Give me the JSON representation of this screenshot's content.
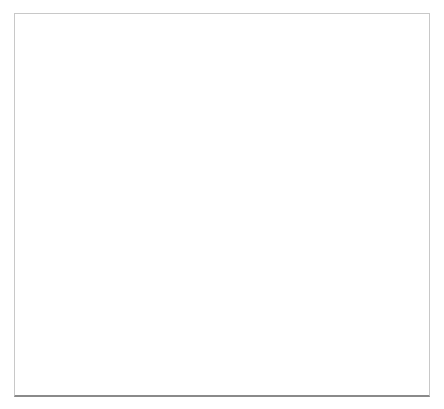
{
  "axis": {
    "unit_label": "cal BP",
    "ticks": [
      5900,
      5800,
      5700,
      5600,
      5500,
      5400,
      5300,
      5200,
      5100,
      5000,
      4900,
      4800,
      4700,
      4600,
      4500,
      4400,
      4300
    ]
  },
  "periods": [
    {
      "label": "EN 1",
      "start": 5900,
      "end": 5450,
      "color": "#d4d4d4"
    },
    {
      "label": "EN 2",
      "start": 5450,
      "end": 5300,
      "color": "#e6e6e6"
    },
    {
      "label": "a",
      "start": 5300,
      "end": 5250,
      "color": "#a9a9a9"
    },
    {
      "label": "MN A Ib",
      "start": 5250,
      "end": 5100,
      "color": "#c4c4c4"
    },
    {
      "label": "MN A II",
      "start": 5100,
      "end": 4970,
      "color": "#dcdcdc"
    },
    {
      "label": "MN A III-IV",
      "start": 4970,
      "end": 4910,
      "color": "#d0d0d0"
    },
    {
      "label": "MN A V",
      "start": 4910,
      "end": 4790,
      "color": "#b6b6b6"
    },
    {
      "label": "MN B I",
      "start": 4790,
      "end": 4620,
      "color": "#e2e2e2"
    },
    {
      "label": "MN B II",
      "start": 4620,
      "end": 4440,
      "color": "#d0d0d0"
    },
    {
      "label": "MN B III",
      "start": 4440,
      "end": 4350,
      "color": "#a6a6a6"
    }
  ],
  "bands": [
    {
      "label": "intensity of ornamentation"
    },
    {
      "label_lines": [
        "regionalisation",
        "of pottery styles"
      ]
    },
    {
      "labels": [
        {
          "lines": [
            "construction",
            "of enclosures"
          ]
        },
        {
          "lines": [
            "secondary use"
          ]
        },
        {
          "lines": [
            "construction",
            "of enclosures"
          ]
        }
      ]
    },
    {
      "labels": [
        {
          "lines": [
            "construction",
            "of earthen long barrows"
          ]
        },
        {
          "lines": [
            "construction",
            "of megaliths"
          ]
        },
        {
          "lines": [
            "secondary use"
          ]
        }
      ]
    },
    {
      "label": "copper import"
    },
    {
      "label": "opening of the landscape"
    },
    {
      "label": "intensity of bog depositions"
    }
  ]
}
